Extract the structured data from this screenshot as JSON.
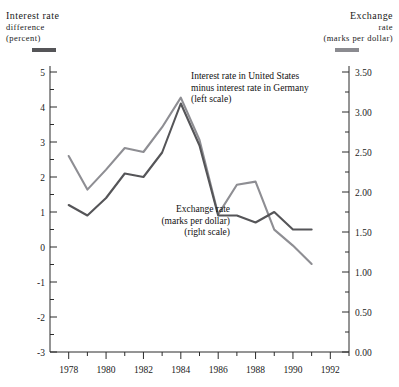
{
  "header": {
    "left": {
      "line1": "Interest rate",
      "line2": "difference",
      "line3": "(percent)",
      "swatch_color": "#555558"
    },
    "right": {
      "line1": "Exchange",
      "line2": "rate",
      "line3": "(marks per dollar)",
      "swatch_color": "#8e8e93"
    }
  },
  "annotations": {
    "interest": {
      "line1": "Interest rate in United States",
      "line2": "minus interest rate in Germany",
      "line3": "(left scale)"
    },
    "exchange": {
      "line1": "Exchange rate",
      "line2": "(marks per dollar)",
      "line3": "(right scale)"
    }
  },
  "chart_data": {
    "type": "line",
    "title": "",
    "xlabel": "",
    "grid": false,
    "legend": "top-swatches",
    "x": [
      1978,
      1979,
      1980,
      1981,
      1982,
      1983,
      1984,
      1985,
      1986,
      1987,
      1988,
      1989,
      1990,
      1991
    ],
    "x_tick_labels": [
      "1978",
      "1980",
      "1982",
      "1984",
      "1986",
      "1988",
      "1990",
      "1992"
    ],
    "x_ticks_major": [
      1978,
      1980,
      1982,
      1984,
      1986,
      1988,
      1990,
      1992
    ],
    "xlim": [
      1977,
      1993
    ],
    "left_axis": {
      "label": "Interest rate difference (percent)",
      "ylim": [
        -3,
        5
      ],
      "tick_labels": [
        "5",
        "4",
        "3",
        "2",
        "1",
        "0",
        "-1",
        "-2",
        "-3"
      ],
      "ticks_major": [
        5,
        4,
        3,
        2,
        1,
        0,
        -1,
        -2,
        -3
      ],
      "minor_step": 0.5
    },
    "right_axis": {
      "label": "Exchange rate (marks per dollar)",
      "ylim": [
        0.0,
        3.5
      ],
      "tick_labels": [
        "3.50",
        "3.00",
        "2.50",
        "2.00",
        "1.50",
        "1.00",
        "0.50",
        "0.00"
      ],
      "ticks_major": [
        3.5,
        3.0,
        2.5,
        2.0,
        1.5,
        1.0,
        0.5,
        0.0
      ],
      "minor_step": 0.25
    },
    "series": [
      {
        "name": "Interest rate in United States minus interest rate in Germany (left scale)",
        "axis": "left",
        "units": "percent",
        "color": "#555558",
        "values": [
          1.2,
          0.9,
          1.4,
          2.1,
          2.0,
          2.7,
          4.1,
          2.9,
          0.9,
          0.9,
          0.7,
          1.0,
          0.5,
          0.5
        ]
      },
      {
        "name": "Exchange rate (marks per dollar) (right scale)",
        "axis": "right",
        "units": "marks per dollar",
        "color": "#8e8e93",
        "values": [
          2.6,
          2.05,
          2.45,
          3.05,
          3.0,
          3.5,
          4.5,
          3.4,
          1.85,
          2.4,
          2.45,
          1.25,
          0.8,
          -0.6
        ]
      }
    ],
    "series_left_values_percent": [
      1.2,
      0.9,
      1.4,
      2.1,
      2.0,
      2.7,
      4.1,
      2.9,
      0.9,
      0.9,
      0.7,
      1.0,
      0.5,
      0.5
    ],
    "series_right_values_marks": [
      2.45,
      2.03,
      2.28,
      2.55,
      2.5,
      2.81,
      3.18,
      2.65,
      1.72,
      2.09,
      2.13,
      1.53,
      1.33,
      1.1
    ]
  }
}
